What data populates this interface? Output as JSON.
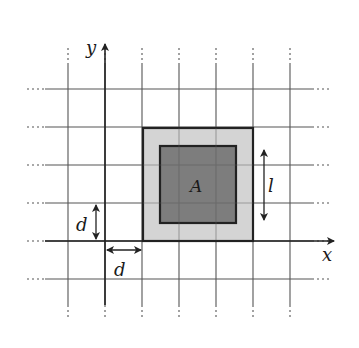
{
  "diagram": {
    "type": "grid-with-squares",
    "grid": {
      "vertical_lines_x": [
        68,
        105,
        142,
        179,
        216,
        253,
        290
      ],
      "horizontal_lines_y": [
        89,
        127,
        165,
        203,
        241,
        279
      ],
      "spacing_label": "d",
      "line_color": "#555555"
    },
    "axes": {
      "x_label": "x",
      "y_label": "y",
      "origin": [
        105,
        241
      ]
    },
    "outer_square": {
      "x": 143,
      "y": 128,
      "w": 110,
      "h": 113,
      "fill": "#d4d4d4",
      "stroke": "#222222"
    },
    "inner_square": {
      "x": 160,
      "y": 146,
      "w": 76,
      "h": 77,
      "fill": "#7d7d7d",
      "stroke": "#222222",
      "label": "A"
    },
    "dimension_labels": {
      "side_length": "l",
      "vertical_spacing": "d",
      "horizontal_spacing": "d"
    },
    "colors": {
      "arrow": "#222222",
      "text": "#1a1a1a"
    }
  }
}
